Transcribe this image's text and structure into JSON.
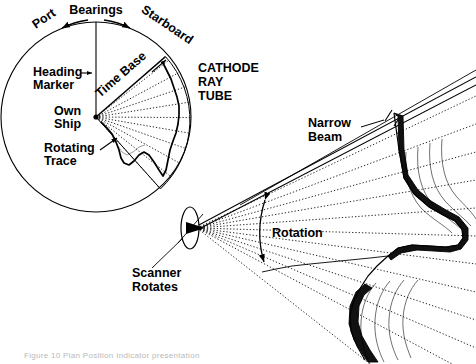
{
  "figure": {
    "title_visible": false,
    "caption": "Figure 10  Plan Position Indicator presentation",
    "background_color": "#ffffff",
    "ink_color": "#000000"
  },
  "ppi": {
    "name": "plan-position-indicator",
    "center": {
      "x": 96,
      "y": 117
    },
    "radius": 95,
    "labels": {
      "bearings": "Bearings",
      "port": "Port",
      "starboard": "Starboard",
      "heading_marker": "Heading\nMarker",
      "heading_marker_line1": "Heading",
      "heading_marker_line2": "Marker",
      "own_ship_line1": "Own",
      "own_ship_line2": "Ship",
      "rotating_trace_line1": "Rotating",
      "rotating_trace_line2": "Trace",
      "time_base": "Time Base",
      "crt_line1": "CATHODE",
      "crt_line2": "RAY",
      "crt_line3": "TUBE"
    },
    "sweep": {
      "start_angle_deg": -48,
      "end_angle_deg": 44,
      "radial_count": 13,
      "radial_style": "dotted"
    }
  },
  "scanner": {
    "name": "scanner-assembly",
    "center": {
      "x": 190,
      "y": 228
    },
    "ellipse_rx": 9,
    "ellipse_ry": 21,
    "labels": {
      "scanner_line1": "Scanner",
      "scanner_line2": "Rotates"
    }
  },
  "beam": {
    "name": "radar-beam-fan",
    "labels": {
      "narrow_beam_line1": "Narrow",
      "narrow_beam_line2": "Beam",
      "rotation": "Rotation"
    },
    "ray_count": 11,
    "ray_style": "dotted"
  },
  "terrain": {
    "name": "coastline-echo",
    "description": "shaded coastline contour returning echoes"
  }
}
